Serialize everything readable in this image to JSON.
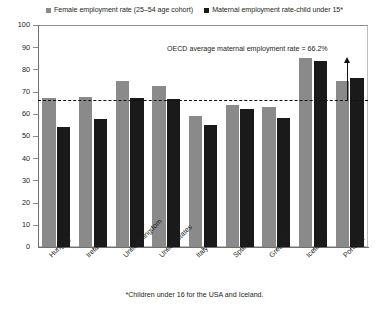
{
  "chart_data": {
    "type": "bar",
    "title": "",
    "subtitle": "",
    "xlabel": "",
    "ylabel": "",
    "ylim": [
      0,
      100
    ],
    "yticks": [
      0,
      10,
      20,
      30,
      40,
      50,
      60,
      70,
      80,
      90,
      100
    ],
    "grid": false,
    "legend_position": "top-center",
    "categories": [
      "Hungary",
      "Ireland",
      "United Kingdom",
      "United States",
      "Italy",
      "Spain",
      "Greece",
      "Iceland",
      "Portugal"
    ],
    "series": [
      {
        "name": "Female employment rate (25–54 age cohort)",
        "color": "#8a8a8a",
        "values": [
          67,
          67.5,
          75,
          72.5,
          59,
          64,
          63,
          85,
          75
        ]
      },
      {
        "name": "Maternal employment rate-child under 15*",
        "color": "#1a1a1a",
        "values": [
          54,
          57.5,
          67,
          66.5,
          55,
          62,
          58,
          84,
          76
        ]
      }
    ],
    "annotations": [
      {
        "text": "OECD average maternal employment rate = 66.2%",
        "value": 66.2,
        "type": "reference-line-label"
      }
    ],
    "reference_line": {
      "label": "OECD average maternal employment rate",
      "value": 66.2,
      "style": "dashed"
    },
    "footnote": "*Children under 16 for the USA and Iceland."
  },
  "legend": {
    "items": [
      {
        "label": "Female employment rate (25–54 age cohort)",
        "color": "#8a8a8a"
      },
      {
        "label": "Maternal employment rate-child under 15*",
        "color": "#1a1a1a"
      }
    ]
  }
}
